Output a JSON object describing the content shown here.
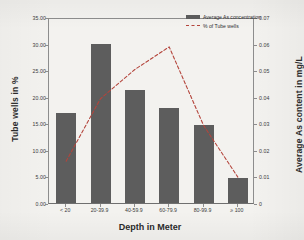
{
  "chart_data": {
    "type": "bar",
    "title": "",
    "xlabel": "Depth in Meter",
    "ylabel": "Tube wells in %",
    "y2label": "Average As content in mg/L",
    "categories": [
      "< 20",
      "20-39.9",
      "40-59.9",
      "60-79.9",
      "80-99.9",
      "≥ 100"
    ],
    "ylim": [
      0,
      35
    ],
    "y2lim": [
      0,
      0.07
    ],
    "grid": false,
    "legend_position": "top-right",
    "ytick_labels": [
      "0.00",
      "5.00",
      "10.00",
      "15.00",
      "20.00",
      "25.00",
      "30.00",
      "35.00"
    ],
    "ytick_values": [
      0,
      5,
      10,
      15,
      20,
      25,
      30,
      35
    ],
    "y2tick_labels": [
      "0",
      "0.01",
      "0.02",
      "0.03",
      "0.04",
      "0.05",
      "0.06",
      "0.07"
    ],
    "y2tick_values": [
      0,
      0.01,
      0.02,
      0.03,
      0.04,
      0.05,
      0.06,
      0.07
    ],
    "series": [
      {
        "name": "% of Tube wells",
        "type": "bar",
        "axis": "left",
        "color": "#5d5d5d",
        "values": [
          16.9,
          30.0,
          21.3,
          17.8,
          14.7,
          4.8
        ]
      },
      {
        "name": "Average As concentration",
        "type": "line",
        "axis": "right",
        "color": "#b4453c",
        "style": "dashed",
        "values": [
          0.0165,
          0.04,
          0.051,
          0.0595,
          0.03,
          0.0105
        ]
      }
    ],
    "legend": [
      {
        "label": "Average As concentration",
        "marker": "bar-swatch",
        "color": "#5d5d5d"
      },
      {
        "label": "% of Tube wells",
        "marker": "dashed-line",
        "color": "#b4453c"
      }
    ]
  }
}
